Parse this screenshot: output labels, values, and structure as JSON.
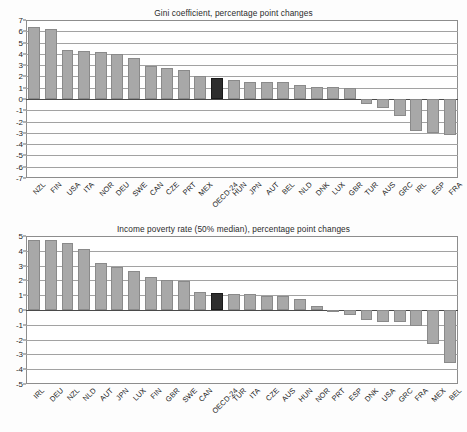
{
  "page": {
    "clipped_header_text": "",
    "bar_color": "#a8a8a8",
    "highlight_color": "#2e2e2e",
    "highlight_label": "OECD-24"
  },
  "chart_data": [
    {
      "type": "bar",
      "id": "gini",
      "title": "Gini coefficient, percentage point changes",
      "xlabel": "",
      "ylabel": "",
      "ylim": [
        -7,
        7
      ],
      "yticks": [
        7,
        6,
        5,
        4,
        3,
        2,
        1,
        0,
        -1,
        -2,
        -3,
        -4,
        -5,
        -6,
        -7
      ],
      "ytick_labels": [
        "7",
        "6",
        "5",
        "4",
        "3",
        "2",
        "1",
        "0",
        "-1",
        "-2",
        "-3",
        "-4",
        "-5",
        "-6",
        "-7"
      ],
      "grid": true,
      "legend": "none",
      "highlight_category": "OECD-24",
      "categories": [
        "NZL",
        "FIN",
        "USA",
        "ITA",
        "NOR",
        "DEU",
        "SWE",
        "CAN",
        "CZE",
        "PRT",
        "MEX",
        "OECD-24",
        "HUN",
        "JPN",
        "AUT",
        "BEL",
        "NLD",
        "DNK",
        "LUX",
        "GBR",
        "TUR",
        "AUS",
        "GRC",
        "IRL",
        "ESP",
        "FRA"
      ],
      "values": [
        6.35,
        6.2,
        4.35,
        4.25,
        4.15,
        4.0,
        3.65,
        2.95,
        2.75,
        2.6,
        2.05,
        1.9,
        1.7,
        1.55,
        1.55,
        1.5,
        1.2,
        1.1,
        1.05,
        0.95,
        -0.4,
        -0.8,
        -1.5,
        -2.8,
        -3.0,
        -3.15
      ]
    },
    {
      "type": "bar",
      "id": "poverty",
      "title": "Income poverty rate (50% median), percentage point changes",
      "xlabel": "",
      "ylabel": "",
      "ylim": [
        -5,
        5
      ],
      "yticks": [
        5,
        4,
        3,
        2,
        1,
        0,
        -1,
        -2,
        -3,
        -4,
        -5
      ],
      "ytick_labels": [
        "5",
        "4",
        "3",
        "2",
        "1",
        "0",
        "-1",
        "-2",
        "-3",
        "-4",
        "-5"
      ],
      "grid": true,
      "legend": "none",
      "highlight_category": "OECD-24",
      "categories": [
        "IRL",
        "DEU",
        "NZL",
        "NLD",
        "AUT",
        "JPN",
        "LUX",
        "FIN",
        "GBR",
        "SWE",
        "CAN",
        "OECD-24",
        "TUR",
        "ITA",
        "CZE",
        "AUS",
        "HUN",
        "NOR",
        "PRT",
        "ESP",
        "DNK",
        "USA",
        "GRC",
        "FRA",
        "MEX",
        "BEL"
      ],
      "values": [
        4.75,
        4.7,
        4.55,
        4.15,
        3.15,
        2.9,
        2.65,
        2.2,
        2.05,
        1.95,
        1.25,
        1.15,
        1.05,
        1.05,
        0.95,
        0.95,
        0.75,
        0.3,
        -0.1,
        -0.35,
        -0.7,
        -0.8,
        -0.8,
        -1.1,
        -2.3,
        -3.6
      ]
    }
  ]
}
